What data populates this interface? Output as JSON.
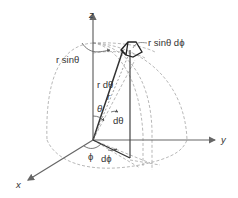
{
  "figure": {
    "axes": {
      "z": "z",
      "y": "y",
      "x": "x"
    },
    "labels": {
      "r_sin_theta": "r sinθ",
      "r_sin_theta_dphi": "r sinθ dϕ",
      "r_dtheta": "r dθ",
      "r": "r",
      "theta": "θ",
      "dtheta": "dθ",
      "phi": "ϕ",
      "dphi": "dϕ"
    },
    "colors": {
      "axis": "#666666",
      "dashed": "#999999",
      "solid": "#333333",
      "text": "#333333"
    }
  }
}
